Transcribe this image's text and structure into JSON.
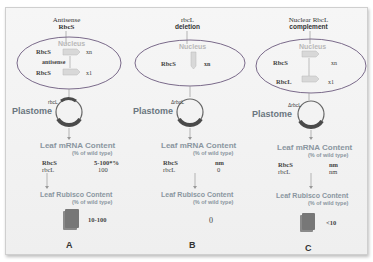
{
  "panels": [
    {
      "id": "A",
      "header_line1": "Antisense",
      "header_line2": "RbcS",
      "nucleus_label": "Nucleus",
      "gene1": "RbcS",
      "gene1_suffix": "xn",
      "between_label": "antisense",
      "gene2": "RbcS",
      "gene2_suffix": "x1",
      "plastome_gene": "rbcL",
      "plastome_label": "Plastome",
      "mrna_title": "Leaf mRNA Content",
      "mrna_sub": "(% of wild type)",
      "mrna_rows": [
        {
          "gene": "RbcS",
          "value": "5-100*%"
        },
        {
          "gene": "rbcL",
          "value": "100"
        }
      ],
      "rubisco_title": "Leaf Rubisco Content",
      "rubisco_sub": "(% of wild type)",
      "rubisco_value": "10-100",
      "letter": "A"
    },
    {
      "id": "B",
      "header_line1": "rbcL",
      "header_line2": "deletion",
      "nucleus_label": "Nucleus",
      "gene1": "RbcS",
      "gene1_suffix": "xn",
      "plastome_gene": "ΔrbcL",
      "plastome_label": "Plastome",
      "mrna_title": "Leaf mRNA Content",
      "mrna_sub": "(% of wild type)",
      "mrna_rows": [
        {
          "gene": "RbcS",
          "value": "nm"
        },
        {
          "gene": "rbcL",
          "value": "0"
        }
      ],
      "rubisco_title": "Leaf Rubisco Content",
      "rubisco_sub": "(% of wild type)",
      "rubisco_value": "0",
      "letter": "B"
    },
    {
      "id": "C",
      "header_line1": "Nuclear RbcL",
      "header_line2": "complement",
      "nucleus_label": "Nucleus",
      "gene1": "RbcS",
      "gene1_suffix": "xn",
      "gene2": "RbcL",
      "gene2_suffix": "x1",
      "plastome_gene": "ΔrbcL",
      "plastome_label": "Plastome",
      "mrna_title": "Leaf mRNA Content",
      "mrna_sub": "(% of wild type)",
      "mrna_rows": [
        {
          "gene": "RbcS",
          "value": "nm"
        },
        {
          "gene": "rbcL",
          "value": "nm"
        }
      ],
      "rubisco_title": "Leaf Rubisco Content",
      "rubisco_sub": "(% of wild type)",
      "rubisco_value": "<10",
      "letter": "C"
    }
  ],
  "colors": {
    "nucleus_outline": "#7a6a8a",
    "gene_box": "#d8d8d8",
    "plastome_ring": "#555555",
    "plastome_thick": "#4a4a4a",
    "rubisco_block": "#7a7a7a",
    "arrow": "#888888",
    "title_color": "#8a96a0"
  }
}
